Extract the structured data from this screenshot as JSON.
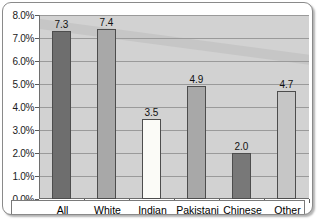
{
  "chart_data": {
    "type": "bar",
    "title": "",
    "xlabel": "",
    "ylabel": "",
    "categories": [
      "All",
      "White",
      "Indian",
      "Pakistani",
      "Chinese",
      "Other"
    ],
    "values": [
      7.3,
      7.4,
      3.5,
      4.9,
      2.0,
      4.7
    ],
    "data_labels": [
      "7.3",
      "7.4",
      "3.5",
      "4.9",
      "2.0",
      "4.7"
    ],
    "bar_colors": [
      "#6e6e6e",
      "#a8a8a8",
      "#fbfbf7",
      "#a8a8a8",
      "#787878",
      "#c6c6c6"
    ],
    "ylim": [
      0,
      8
    ],
    "ytick_values": [
      0,
      1,
      2,
      3,
      4,
      5,
      6,
      7,
      8
    ],
    "ytick_labels": [
      "0.0%",
      "1.0%",
      "2.0%",
      "3.0%",
      "4.0%",
      "5.0%",
      "6.0%",
      "7.0%",
      "8.0%"
    ],
    "grid": true,
    "legend": "none",
    "plot_background": "#d2d2d2",
    "axis_color": "#6e6e6e",
    "frame_border_color": "#8a8a8a"
  }
}
